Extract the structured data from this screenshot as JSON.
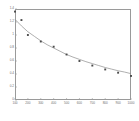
{
  "chart_data": {
    "type": "scatter",
    "title": "",
    "subtitle": "",
    "xlabel": "",
    "ylabel": "",
    "xlim": [
      100,
      1000
    ],
    "ylim": [
      0,
      1.4
    ],
    "grid": false,
    "legend": null,
    "x_ticks": [
      100,
      200,
      300,
      400,
      500,
      600,
      700,
      800,
      900,
      1000
    ],
    "x_tick_labels": [
      "100",
      "200",
      "300",
      "400",
      "500",
      "600",
      "700",
      "800",
      "900",
      "1000"
    ],
    "y_ticks": [
      0,
      0.2,
      0.4,
      0.6,
      0.8,
      1,
      1.2,
      1.4
    ],
    "y_tick_labels": [
      "0",
      "0.2",
      "0.4",
      "0.6",
      "0.8",
      "1",
      "1.2",
      "1.4"
    ],
    "series": [
      {
        "name": "data points",
        "marker": "square",
        "color": "#4a4a4a",
        "x": [
          100,
          150,
          200,
          300,
          400,
          500,
          600,
          700,
          800,
          900,
          1000
        ],
        "y": [
          1.36,
          1.23,
          1.0,
          0.9,
          0.82,
          0.7,
          0.6,
          0.53,
          0.47,
          0.42,
          0.37
        ]
      },
      {
        "name": "fitted curve",
        "marker": "line",
        "color": "#8c8c8c",
        "x": [
          100,
          150,
          200,
          250,
          300,
          350,
          400,
          450,
          500,
          550,
          600,
          650,
          700,
          750,
          800,
          850,
          900,
          950,
          1000
        ],
        "y": [
          1.24,
          1.14,
          1.05,
          0.98,
          0.91,
          0.85,
          0.8,
          0.75,
          0.7,
          0.66,
          0.625,
          0.59,
          0.56,
          0.53,
          0.5,
          0.475,
          0.45,
          0.43,
          0.405
        ]
      }
    ]
  }
}
